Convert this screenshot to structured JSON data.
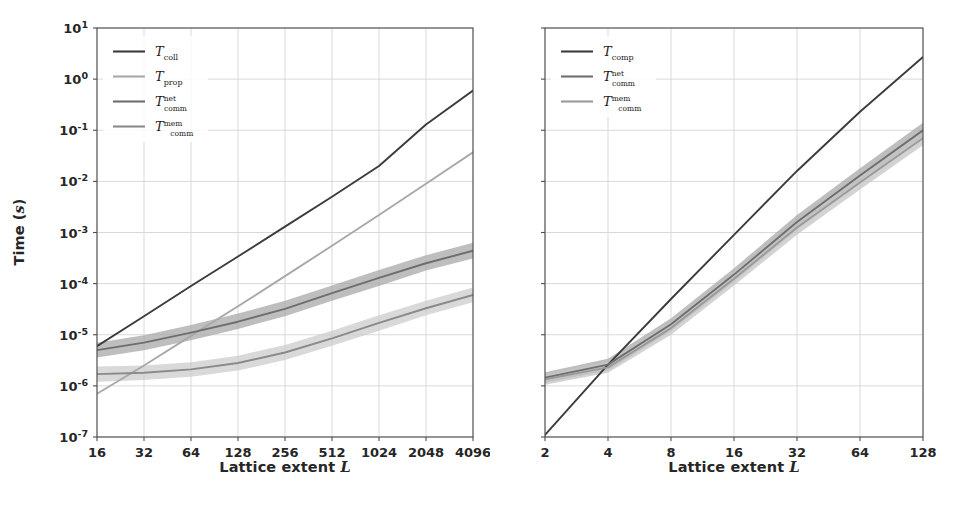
{
  "figure": {
    "background": "#ffffff",
    "width": 965,
    "height": 508
  },
  "panels": [
    {
      "id": "left",
      "name": "left-plot",
      "xlabel_prefix": "Lattice extent ",
      "xlabel_symbol": "L",
      "ylabel_prefix": "Time (",
      "ylabel_symbol": "s",
      "ylabel_suffix": ")"
    },
    {
      "id": "right",
      "name": "right-plot",
      "xlabel_prefix": "Lattice extent ",
      "xlabel_symbol": "L",
      "ylabel_prefix": "",
      "ylabel_symbol": "",
      "ylabel_suffix": ""
    }
  ],
  "colors": {
    "axis": "#4d4d4d",
    "grid": "#d9d9d9",
    "text": "#262626",
    "series_dark": "#3b3b3b",
    "series_mid": "#6e6e6e",
    "series_light": "#9a9a9a",
    "band_dark": "#8f8f8f",
    "band_light": "#c4c4c4"
  },
  "chart_data": [
    {
      "type": "line",
      "id": "left-panel",
      "title": "",
      "xlabel": "Lattice extent L",
      "ylabel": "Time (s)",
      "xscale": "log2",
      "yscale": "log10",
      "xlim": [
        16,
        4096
      ],
      "ylim": [
        1e-07,
        10
      ],
      "grid": true,
      "legend_position": "upper left",
      "xticks": [
        16,
        32,
        64,
        128,
        256,
        512,
        1024,
        2048,
        4096
      ],
      "xticklabels": [
        "16",
        "32",
        "64",
        "128",
        "256",
        "512",
        "1024",
        "2048",
        "4096"
      ],
      "yticks": [
        10,
        1,
        0.1,
        0.01,
        0.001,
        0.0001,
        1e-05,
        1e-06,
        1e-07
      ],
      "yticklabels": [
        "10¹",
        "10⁰",
        "10⁻¹",
        "10⁻²",
        "10⁻³",
        "10⁻⁴",
        "10⁻⁵",
        "10⁻⁶",
        "10⁻⁷"
      ],
      "x": [
        16,
        32,
        64,
        128,
        256,
        512,
        1024,
        2048,
        4096
      ],
      "series": [
        {
          "name": "T_coll",
          "label_base": "T",
          "label_sub": "coll",
          "label_sup": "",
          "color": "#3b3b3b",
          "band": false,
          "values": [
            6e-06,
            2.3e-05,
            9e-05,
            0.00034,
            0.0013,
            0.005,
            0.02,
            0.13,
            0.6
          ]
        },
        {
          "name": "T_prop",
          "label_base": "T",
          "label_sub": "prop",
          "label_sup": "",
          "color": "#a8a8a8",
          "band": false,
          "values": [
            7e-07,
            2.5e-06,
            9.5e-06,
            3.6e-05,
            0.00014,
            0.00055,
            0.0022,
            0.009,
            0.037
          ]
        },
        {
          "name": "T_comm_net",
          "label_base": "T",
          "label_sub": "comm",
          "label_sup": "net",
          "color": "#6e6e6e",
          "band": true,
          "band_color": "#a8a8a8",
          "values": [
            5e-06,
            7e-06,
            1.1e-05,
            1.8e-05,
            3.2e-05,
            6.5e-05,
            0.00013,
            0.00025,
            0.00044
          ],
          "band_lower": [
            3.6e-06,
            5e-06,
            7.8e-06,
            1.3e-05,
            2.3e-05,
            4.6e-05,
            9e-05,
            0.00018,
            0.00031
          ],
          "band_upper": [
            7e-06,
            9.8e-06,
            1.55e-05,
            2.6e-05,
            4.6e-05,
            9.2e-05,
            0.000185,
            0.00036,
            0.00063
          ]
        },
        {
          "name": "T_comm_mem",
          "label_base": "T",
          "label_sub": "comm",
          "label_sup": "mem",
          "color": "#8a8a8a",
          "band": true,
          "band_color": "#cccccc",
          "values": [
            1.7e-06,
            1.8e-06,
            2.1e-06,
            2.8e-06,
            4.5e-06,
            8.5e-06,
            1.7e-05,
            3.3e-05,
            6e-05
          ],
          "band_lower": [
            1.2e-06,
            1.3e-06,
            1.5e-06,
            2e-06,
            3.2e-06,
            6.1e-06,
            1.2e-05,
            2.4e-05,
            4.3e-05
          ],
          "band_upper": [
            2.4e-06,
            2.5e-06,
            2.9e-06,
            3.9e-06,
            6.3e-06,
            1.2e-05,
            2.4e-05,
            4.6e-05,
            8.4e-05
          ]
        }
      ]
    },
    {
      "type": "line",
      "id": "right-panel",
      "title": "",
      "xlabel": "Lattice extent L",
      "ylabel": "",
      "xscale": "log2",
      "yscale": "log10",
      "xlim": [
        2,
        128
      ],
      "ylim": [
        1e-07,
        10
      ],
      "grid": true,
      "legend_position": "upper left",
      "xticks": [
        2,
        4,
        8,
        16,
        32,
        64,
        128
      ],
      "xticklabels": [
        "2",
        "4",
        "8",
        "16",
        "32",
        "64",
        "128"
      ],
      "yticks": [
        10,
        1,
        0.1,
        0.01,
        0.001,
        0.0001,
        1e-05,
        1e-06,
        1e-07
      ],
      "yticklabels": [
        "",
        "",
        "",
        "",
        "",
        "",
        "",
        "",
        ""
      ],
      "x": [
        2,
        4,
        8,
        16,
        32,
        64,
        128
      ],
      "series": [
        {
          "name": "T_comp",
          "label_base": "T",
          "label_sub": "comp",
          "label_sup": "",
          "color": "#3b3b3b",
          "band": false,
          "values": [
            1.1e-07,
            2.6e-06,
            5e-05,
            0.0009,
            0.016,
            0.23,
            2.7
          ]
        },
        {
          "name": "T_comm_net",
          "label_base": "T",
          "label_sub": "comm",
          "label_sup": "net",
          "color": "#6e6e6e",
          "band": true,
          "band_color": "#a8a8a8",
          "values": [
            1.45e-06,
            2.6e-06,
            1.6e-05,
            0.00015,
            0.0016,
            0.013,
            0.1
          ],
          "band_lower": [
            1.15e-06,
            2e-06,
            1.2e-05,
            0.00011,
            0.00115,
            0.0095,
            0.073
          ],
          "band_upper": [
            1.85e-06,
            3.4e-06,
            2.1e-05,
            0.0002,
            0.0022,
            0.018,
            0.14
          ]
        },
        {
          "name": "T_comm_mem",
          "label_base": "T",
          "label_sub": "comm",
          "label_sup": "mem",
          "color": "#9a9a9a",
          "band": true,
          "band_color": "#c4c4c4",
          "values": [
            1.35e-06,
            2.3e-06,
            1.35e-05,
            0.000125,
            0.00125,
            0.0095,
            0.07
          ],
          "band_lower": [
            1.05e-06,
            1.8e-06,
            1e-05,
            9.2e-05,
            0.0009,
            0.0069,
            0.051
          ],
          "band_upper": [
            1.75e-06,
            3e-06,
            1.8e-05,
            0.00017,
            0.0017,
            0.013,
            0.096
          ]
        }
      ]
    }
  ]
}
